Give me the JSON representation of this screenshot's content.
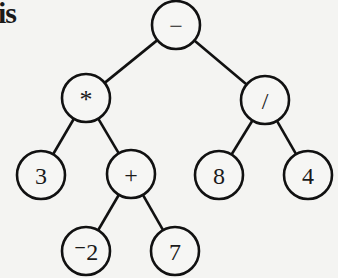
{
  "header_fragment": "is",
  "diagram": {
    "type": "expression-tree",
    "expression": "(3 * (-2 + 7)) - (8 / 4)",
    "node_radius": 24,
    "stroke_color": "#111111",
    "node_fill": "#f6f6f4",
    "nodes": [
      {
        "id": "root",
        "label": "−",
        "x": 176,
        "y": 25
      },
      {
        "id": "mul",
        "label": "*",
        "x": 86,
        "y": 98
      },
      {
        "id": "div",
        "label": "/",
        "x": 265,
        "y": 100
      },
      {
        "id": "n3",
        "label": "3",
        "x": 41,
        "y": 175
      },
      {
        "id": "plus",
        "label": "+",
        "x": 131,
        "y": 174
      },
      {
        "id": "n8",
        "label": "8",
        "x": 219,
        "y": 175
      },
      {
        "id": "n4",
        "label": "4",
        "x": 308,
        "y": 175
      },
      {
        "id": "neg2",
        "label": "⁻2",
        "x": 86,
        "y": 251
      },
      {
        "id": "n7",
        "label": "7",
        "x": 175,
        "y": 251
      }
    ],
    "edges": [
      {
        "from": "root",
        "to": "mul"
      },
      {
        "from": "root",
        "to": "div"
      },
      {
        "from": "mul",
        "to": "n3"
      },
      {
        "from": "mul",
        "to": "plus"
      },
      {
        "from": "div",
        "to": "n8"
      },
      {
        "from": "div",
        "to": "n4"
      },
      {
        "from": "plus",
        "to": "neg2"
      },
      {
        "from": "plus",
        "to": "n7"
      }
    ]
  }
}
